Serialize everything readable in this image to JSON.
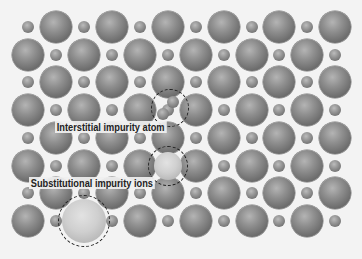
{
  "figure": {
    "background": "#f3f3f3",
    "grid": {
      "columns_x": [
        28,
        56,
        84,
        112,
        140,
        168,
        196,
        224,
        252,
        279,
        307,
        335
      ],
      "rows_y": [
        27,
        55,
        82,
        110,
        138,
        166,
        193,
        221
      ],
      "row_start": [
        "small",
        "large",
        "small",
        "large",
        "small",
        "large",
        "small",
        "large"
      ],
      "large_radius": 16,
      "small_radius": 6
    },
    "replaced_sites": [
      {
        "row": 5,
        "col": 5
      },
      {
        "row": 7,
        "col": 2
      }
    ],
    "substitutional_ions": [
      {
        "x": 168,
        "y": 166,
        "r": 14,
        "ring_r": 20
      },
      {
        "x": 84,
        "y": 221,
        "r": 22,
        "ring_r": 26
      }
    ],
    "interstitial": {
      "ring": {
        "x": 170,
        "y": 108,
        "r": 19
      },
      "atoms": [
        {
          "x": 173,
          "y": 102,
          "r": 6
        },
        {
          "x": 163,
          "y": 114,
          "r": 6
        }
      ]
    },
    "labels": {
      "interstitial": "Interstitial impurity atom",
      "substitutional": "Substitutional impurity ions"
    }
  }
}
